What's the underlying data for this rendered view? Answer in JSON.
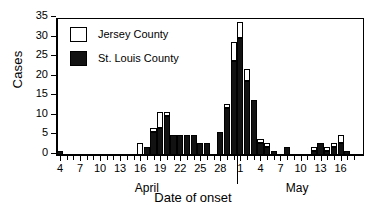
{
  "chart_data": {
    "type": "bar",
    "title": "",
    "xlabel": "Date of onset",
    "ylabel": "Cases",
    "ylim": [
      0,
      35
    ],
    "ytick_values": [
      0,
      5,
      10,
      15,
      20,
      25,
      30,
      35
    ],
    "grid": false,
    "stacked": true,
    "legend_position": "top-left",
    "month_groups": [
      {
        "label": "April",
        "start_index": 0,
        "end_index": 26
      },
      {
        "label": "May",
        "start_index": 27,
        "end_index": 44
      }
    ],
    "x_major_ticks": [
      "4",
      "7",
      "10",
      "13",
      "16",
      "19",
      "22",
      "25",
      "28",
      "1",
      "4",
      "7",
      "10",
      "13",
      "16"
    ],
    "categories": [
      "Apr 4",
      "Apr 5",
      "Apr 6",
      "Apr 7",
      "Apr 8",
      "Apr 9",
      "Apr 10",
      "Apr 11",
      "Apr 12",
      "Apr 13",
      "Apr 14",
      "Apr 15",
      "Apr 16",
      "Apr 17",
      "Apr 18",
      "Apr 19",
      "Apr 20",
      "Apr 21",
      "Apr 22",
      "Apr 23",
      "Apr 24",
      "Apr 25",
      "Apr 26",
      "Apr 27",
      "Apr 28",
      "Apr 29",
      "Apr 30",
      "May 1",
      "May 2",
      "May 3",
      "May 4",
      "May 5",
      "May 6",
      "May 7",
      "May 8",
      "May 9",
      "May 10",
      "May 11",
      "May 12",
      "May 13",
      "May 14",
      "May 15",
      "May 16",
      "May 17",
      "May 18"
    ],
    "series": [
      {
        "name": "St. Louis County",
        "color": "#121212",
        "values": [
          1,
          0,
          0,
          0,
          0,
          0,
          0,
          0,
          0,
          0,
          0,
          0,
          0,
          2,
          6,
          7,
          10,
          5,
          5,
          5,
          5,
          3,
          3,
          0,
          6,
          12,
          24,
          30,
          19,
          14,
          3,
          2,
          1,
          0,
          2,
          0,
          0,
          0,
          1,
          3,
          1,
          2,
          3,
          1,
          0
        ]
      },
      {
        "name": "Jersey County",
        "color": "#ffffff",
        "values": [
          0,
          0,
          0,
          0,
          0,
          0,
          0,
          0,
          0,
          0,
          0,
          0,
          3,
          0,
          1,
          4,
          1,
          0,
          0,
          0,
          0,
          0,
          0,
          0,
          0,
          1,
          5,
          4,
          3,
          0,
          1,
          1,
          0,
          0,
          0,
          0,
          0,
          0,
          1,
          0,
          1,
          1,
          2,
          0,
          0
        ]
      }
    ]
  },
  "legend": {
    "entries": [
      {
        "label": "Jersey County",
        "style": "hollow"
      },
      {
        "label": "St. Louis County",
        "style": "filled"
      }
    ]
  },
  "axes": {
    "y_title": "Cases",
    "x_title": "Date of onset"
  }
}
